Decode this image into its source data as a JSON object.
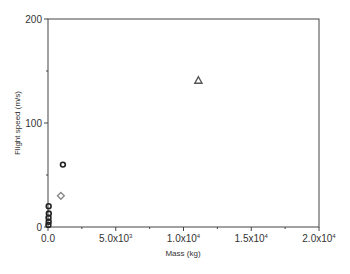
{
  "chart_data": {
    "type": "scatter",
    "title": "",
    "xlabel": "Mass (kg)",
    "ylabel": "Flight speed (m/s)",
    "xlim": [
      0,
      20000
    ],
    "ylim": [
      0,
      200
    ],
    "x_ticks": [
      {
        "value": 0,
        "label": "0.0",
        "sup": ""
      },
      {
        "value": 5000,
        "label": "5.0x10",
        "sup": "3"
      },
      {
        "value": 10000,
        "label": "1.0x10",
        "sup": "4"
      },
      {
        "value": 15000,
        "label": "1.5x10",
        "sup": "4"
      },
      {
        "value": 20000,
        "label": "2.0x10",
        "sup": "4"
      }
    ],
    "y_ticks": [
      {
        "value": 0,
        "label": "0"
      },
      {
        "value": 100,
        "label": "100"
      },
      {
        "value": 200,
        "label": "200"
      }
    ],
    "grid": false,
    "legend": null,
    "series": [
      {
        "name": "circles",
        "marker": "circle",
        "color": "#222222",
        "points": [
          {
            "x": 1100,
            "y": 60
          },
          {
            "x": 50,
            "y": 20
          },
          {
            "x": 60,
            "y": 13
          },
          {
            "x": 40,
            "y": 9
          },
          {
            "x": 50,
            "y": 5
          },
          {
            "x": 30,
            "y": 2
          }
        ]
      },
      {
        "name": "diamonds",
        "marker": "diamond",
        "color": "#888888",
        "points": [
          {
            "x": 950,
            "y": 30
          }
        ]
      },
      {
        "name": "triangles",
        "marker": "triangle",
        "color": "#555555",
        "points": [
          {
            "x": 11100,
            "y": 141
          }
        ]
      }
    ]
  }
}
